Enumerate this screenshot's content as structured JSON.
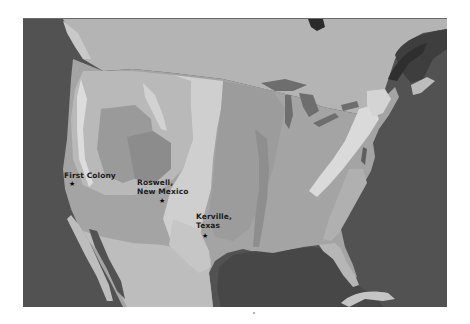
{
  "map": {
    "type": "shaded-relief map of the contiguous United States",
    "colors": {
      "ocean": "#525252",
      "canada_land": "#b4b4b4",
      "mexico_land": "#bdbdbd",
      "plains": "#c8c8c8",
      "central_lowlands": "#9c9c9c",
      "eastern_lowlands": "#a6a6a6",
      "mountains_high": "#d8d8d8",
      "plateau": "#8e8e8e",
      "lakes": "#6e6e6e"
    },
    "locations": [
      {
        "label": "First Colony",
        "marker": "★"
      },
      {
        "label_line1": "Roswell,",
        "label_line2": "New Mexico",
        "marker": "★"
      },
      {
        "label_line1": "Kerville,",
        "label_line2": "Texas",
        "marker": "★"
      }
    ]
  }
}
